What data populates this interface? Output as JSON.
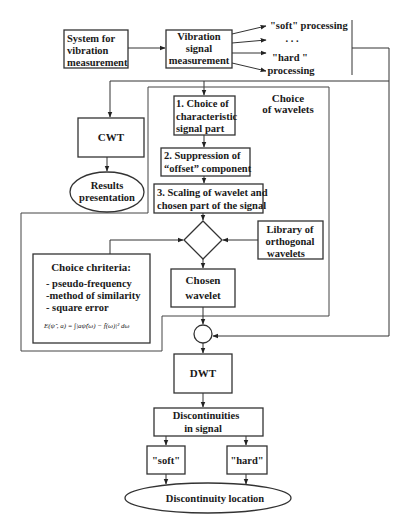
{
  "diagram": {
    "colors": {
      "stroke": "#333333",
      "text": "#1a1a1a",
      "background": "#ffffff"
    },
    "nodes": {
      "system": {
        "lines": [
          "System for",
          "vibration",
          "measurement"
        ]
      },
      "vibration": {
        "lines": [
          "Vibration",
          "signal",
          "measurement"
        ]
      },
      "outputs": {
        "soft": "\"soft\" processing",
        "dots": ". . .",
        "hard_1": "\"hard \"",
        "hard_2": "processing"
      },
      "wavelet_group": {
        "lines": [
          "Choice",
          "of wavelets"
        ]
      },
      "step1": {
        "lines": [
          "1. Choice of",
          "characteristic",
          "signal part"
        ]
      },
      "step2": {
        "lines": [
          "2. Suppression of",
          "“offset” component"
        ]
      },
      "step3": {
        "lines": [
          "3. Scaling of wavelet and",
          "chosen part of the signal"
        ]
      },
      "cwt": {
        "label": "CWT"
      },
      "results": {
        "lines": [
          "Results",
          "presentation"
        ]
      },
      "library": {
        "lines": [
          "Library of",
          "orthogonal",
          "wavelets"
        ]
      },
      "criteria": {
        "title": "Choice chriteria:",
        "items": [
          "- pseudo-frequency",
          "-method of similarity",
          "- square error"
        ],
        "formula": "E(ψ̂ , a) = ∫|aψ̂(ω) − f̂(ω)|² dω"
      },
      "chosen": {
        "lines": [
          "Chosen",
          "wavelet"
        ]
      },
      "dwt": {
        "label": "DWT"
      },
      "discontinuities": {
        "lines": [
          "Discontinuities",
          "in signal"
        ]
      },
      "soft": {
        "label": "\"soft\""
      },
      "hard": {
        "label": "\"hard\""
      },
      "location": {
        "label": "Discontinuity location"
      }
    }
  }
}
